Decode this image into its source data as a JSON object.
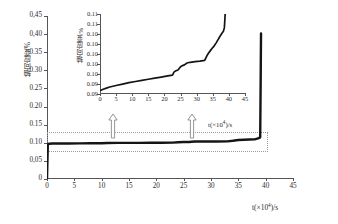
{
  "chart_data": {
    "type": "line",
    "title": "",
    "xlabel": "t(×10⁴)/s",
    "ylabel": "轴向应变/%",
    "xlim": [
      0,
      45
    ],
    "ylim": [
      0,
      0.45
    ],
    "grid": false,
    "legend": "none",
    "x_ticks": [
      "0",
      "5",
      "10",
      "15",
      "20",
      "25",
      "30",
      "35",
      "40",
      "45"
    ],
    "y_ticks": [
      "0",
      "0,05",
      "0.10",
      "0.15",
      "0.20",
      "0.25",
      "0.30",
      "0.35",
      "0,40",
      "0,45"
    ],
    "series": [
      {
        "name": "轴向应变",
        "x": [
          0,
          0.15,
          0.4,
          1,
          2,
          4,
          6,
          8,
          10,
          11,
          13,
          15,
          17,
          19,
          21,
          23,
          24,
          25,
          26,
          27,
          29,
          31,
          33,
          34,
          35,
          36,
          37,
          38,
          38.6,
          39,
          39.1,
          39.15
        ],
        "values": [
          0,
          0.0955,
          0.0975,
          0.0978,
          0.098,
          0.0982,
          0.0984,
          0.0986,
          0.0988,
          0.0995,
          0.0996,
          0.0997,
          0.0998,
          0.0999,
          0.1,
          0.1005,
          0.1015,
          0.102,
          0.1022,
          0.1035,
          0.1036,
          0.1037,
          0.104,
          0.1055,
          0.1075,
          0.1085,
          0.109,
          0.1095,
          0.112,
          0.115,
          0.3,
          0.402
        ]
      }
    ],
    "annotations": {
      "dashed_box": {
        "x0": 0,
        "x1": 40,
        "y0": 0.079,
        "y1": 0.131
      },
      "arrows": [
        "callout-arrow-left",
        "callout-arrow-right"
      ]
    },
    "inset": {
      "type": "line",
      "xlabel": "t(×10⁴)/s",
      "ylabel": "轴向应变/%",
      "xlim": [
        0,
        45
      ],
      "ylim": [
        0.0938,
        0.1155
      ],
      "x_ticks": [
        "0",
        "5",
        "10",
        "15",
        "20",
        "25",
        "30",
        "35",
        "40",
        "45"
      ],
      "y_ticks": [
        "0.11",
        "0.11",
        "0.10",
        "0.10",
        "0.10",
        "0.10",
        "0.10",
        "0.09",
        "0.09"
      ],
      "series": [
        {
          "name": "轴向应变",
          "x": [
            0.3,
            1,
            2,
            3,
            5,
            7,
            9,
            11,
            13,
            15,
            17,
            19,
            21,
            22.5,
            23,
            23.6,
            24.2,
            25,
            25.6,
            26.2,
            27,
            28,
            29.5,
            31,
            32.5,
            33.2,
            33.6,
            34.2,
            34.8,
            35.4,
            36,
            36.6,
            37.2,
            37.8,
            38.3,
            38.6,
            38.75,
            38.85
          ],
          "values": [
            0.0948,
            0.0951,
            0.0954,
            0.0957,
            0.0961,
            0.0965,
            0.0969,
            0.0972,
            0.0975,
            0.0978,
            0.0981,
            0.0984,
            0.0987,
            0.0989,
            0.0998,
            0.1001,
            0.1003,
            0.1012,
            0.1015,
            0.1017,
            0.1022,
            0.1024,
            0.1026,
            0.1027,
            0.1029,
            0.1042,
            0.1048,
            0.1055,
            0.1062,
            0.1068,
            0.1076,
            0.1085,
            0.1094,
            0.1102,
            0.1108,
            0.1118,
            0.114,
            0.1156
          ]
        }
      ]
    }
  },
  "axis_labels": {
    "main_x": "t(×10⁴)/s",
    "main_y": "轴向应变/%",
    "inset_x": "t(×10⁴)/s",
    "inset_y": "轴向应变/%",
    "x_prefix": "t(×10",
    "x_exp": "4",
    "x_suffix": ")/s"
  },
  "colors": {
    "curve": "#141414",
    "axis": "#555555",
    "dash_box": "#9a9a9a",
    "arrow_stroke": "#8a8a8a"
  }
}
